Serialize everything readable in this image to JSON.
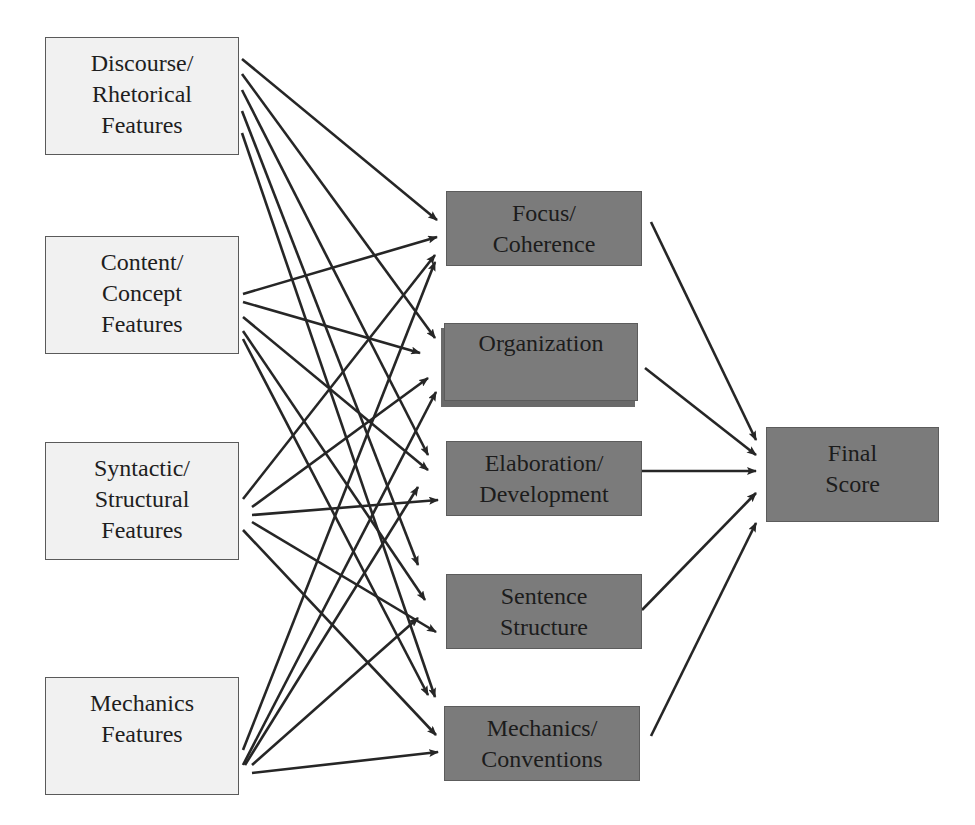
{
  "diagram": {
    "type": "feature-to-trait scoring model",
    "inputs": [
      {
        "id": "discourse",
        "label": "Discourse/\nRhetorical\nFeatures"
      },
      {
        "id": "content",
        "label": "Content/\nConcept\nFeatures"
      },
      {
        "id": "syntactic",
        "label": "Syntactic/\nStructural\nFeatures"
      },
      {
        "id": "mechanics",
        "label": "Mechanics\nFeatures"
      }
    ],
    "traits": [
      {
        "id": "focus",
        "label": "Focus/\nCoherence"
      },
      {
        "id": "organization",
        "label": "Organization"
      },
      {
        "id": "elaboration",
        "label": "Elaboration/\nDevelopment"
      },
      {
        "id": "sentence",
        "label": "Sentence\nStructure"
      },
      {
        "id": "conventions",
        "label": "Mechanics/\nConventions"
      }
    ],
    "output": {
      "id": "final",
      "label": "Final\nScore"
    },
    "edges": [
      [
        "discourse",
        "focus"
      ],
      [
        "discourse",
        "organization"
      ],
      [
        "discourse",
        "elaboration"
      ],
      [
        "discourse",
        "sentence"
      ],
      [
        "discourse",
        "conventions"
      ],
      [
        "content",
        "focus"
      ],
      [
        "content",
        "organization"
      ],
      [
        "content",
        "elaboration"
      ],
      [
        "content",
        "sentence"
      ],
      [
        "content",
        "conventions"
      ],
      [
        "syntactic",
        "focus"
      ],
      [
        "syntactic",
        "organization"
      ],
      [
        "syntactic",
        "elaboration"
      ],
      [
        "syntactic",
        "sentence"
      ],
      [
        "syntactic",
        "conventions"
      ],
      [
        "mechanics",
        "focus"
      ],
      [
        "mechanics",
        "organization"
      ],
      [
        "mechanics",
        "elaboration"
      ],
      [
        "mechanics",
        "sentence"
      ],
      [
        "mechanics",
        "conventions"
      ],
      [
        "focus",
        "final"
      ],
      [
        "organization",
        "final"
      ],
      [
        "elaboration",
        "final"
      ],
      [
        "sentence",
        "final"
      ],
      [
        "conventions",
        "final"
      ]
    ]
  },
  "colors": {
    "input_fill": "#f1f1f1",
    "trait_fill": "#7b7b7b",
    "arrow": "#262626"
  }
}
